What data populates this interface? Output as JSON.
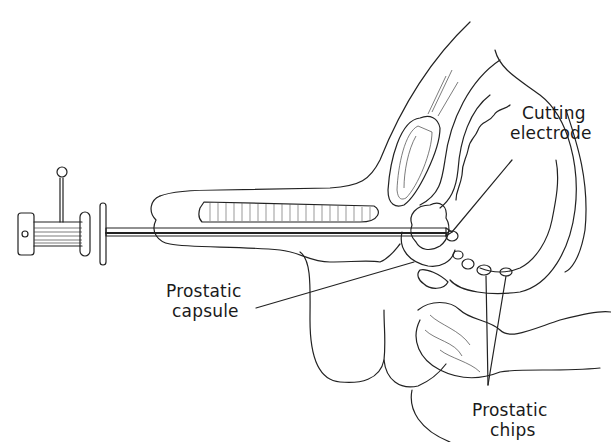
{
  "figure": {
    "labels": {
      "cutting_electrode_line1": "Cutting",
      "cutting_electrode_line2": "electrode",
      "prostatic_capsule_line1": "Prostatic",
      "prostatic_capsule_line2": "capsule",
      "prostatic_chips_line1": "Prostatic",
      "prostatic_chips_line2": "chips"
    }
  }
}
